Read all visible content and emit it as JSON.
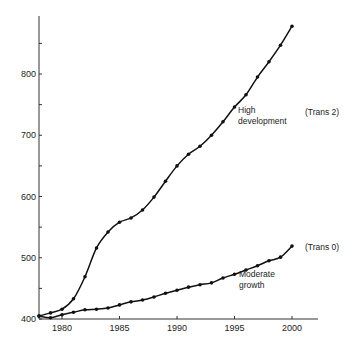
{
  "chart_data": {
    "type": "line",
    "title": "",
    "xlabel": "",
    "ylabel": "",
    "xlim": [
      1978,
      2002
    ],
    "ylim": [
      400,
      880
    ],
    "grid": false,
    "legend": "inline annotations",
    "x": [
      1978,
      1979,
      1980,
      1981,
      1982,
      1983,
      1984,
      1985,
      1986,
      1987,
      1988,
      1989,
      1990,
      1991,
      1992,
      1993,
      1994,
      1995,
      1996,
      1997,
      1998,
      1999,
      2000
    ],
    "x_ticks": [
      1980,
      1985,
      1990,
      1995,
      2000
    ],
    "x_tick_labels": [
      "1980",
      "1985",
      "1990",
      "1995",
      "2000"
    ],
    "y_ticks": [
      400,
      450,
      500,
      550,
      600,
      650,
      700,
      750,
      800,
      850
    ],
    "y_tick_labels": [
      "400",
      "",
      "500",
      "",
      "600",
      "",
      "700",
      "",
      "800",
      ""
    ],
    "series": [
      {
        "name": "High development",
        "tag": "(Trans 2)",
        "values": [
          405,
          410,
          416,
          433,
          469,
          516,
          542,
          558,
          565,
          578,
          599,
          625,
          650,
          669,
          682,
          700,
          722,
          746,
          766,
          795,
          820,
          847,
          878
        ]
      },
      {
        "name": "Moderate growth",
        "tag": "(Trans 0)",
        "values": [
          405,
          402,
          407,
          411,
          415,
          416,
          418,
          423,
          428,
          431,
          436,
          442,
          447,
          452,
          456,
          459,
          467,
          473,
          480,
          487,
          495,
          501,
          519
        ]
      }
    ],
    "annotations": [
      {
        "text_lines": [
          "High",
          "development"
        ],
        "x": 1995.2,
        "y": 735
      },
      {
        "text": "(Trans 2)",
        "x": 1998.8,
        "y": 735
      },
      {
        "text_lines": [
          "Moderate",
          "growth"
        ],
        "x": 1990.3,
        "y": 445
      },
      {
        "text": "(Trans 0)",
        "x": 2000.8,
        "y": 519
      }
    ]
  },
  "labels": {
    "high_line1": "High",
    "high_line2": "development",
    "trans2": "(Trans 2)",
    "moderate_line1": "Moderate",
    "moderate_line2": "growth",
    "trans0": "(Trans 0)"
  }
}
